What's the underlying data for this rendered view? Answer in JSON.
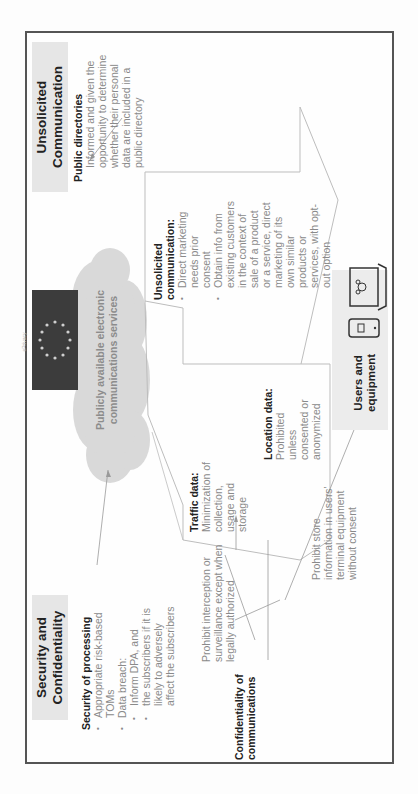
{
  "diagram": {
    "orientation": "rotated-90-ccw",
    "center": {
      "flag_label": "ePrivacy",
      "cloud_label_line1": "Publicly available electronic",
      "cloud_label_line2": "communications services"
    },
    "security_section": {
      "title_line1": "Security and",
      "title_line2": "Confidentiality",
      "processing": {
        "heading": "Security of processing",
        "items": [
          "Appropriate risk-based TOMs",
          "Data breach:"
        ],
        "item1_line1": "Appropriate risk-based",
        "item1_line2": "TOMs",
        "item2": "Data breach:",
        "sub_items": [
          "Inform DPA, and",
          "the subscribers if it is likely to adversely affect the subscribers"
        ],
        "sub1": "Inform DPA, and",
        "sub2_line1": "the subscribers if it is",
        "sub2_line2": "likely to adversely",
        "sub2_line3": "affect the subscribers"
      },
      "confidentiality": {
        "heading_line1": "Confidentiality of",
        "heading_line2": "communications",
        "interception_line1": "Prohibit interception or",
        "interception_line2": "surveillance except when",
        "interception_line3": "legally authorized",
        "storage_line1": "Prohibit store",
        "storage_line2": "information in users'",
        "storage_line3": "terminal equipment",
        "storage_line4": "without consent"
      }
    },
    "traffic": {
      "heading": "Traffic data:",
      "line1": "Minimization of",
      "line2": "collection,",
      "line3": "usage and",
      "line4": "storage"
    },
    "location": {
      "heading": "Location data:",
      "line1": "Prohibited",
      "line2": "unless",
      "line3": "consented or",
      "line4": "anonymized"
    },
    "unsolicited_arrow": {
      "heading_line1": "Unsolicited",
      "heading_line2": "communication:",
      "b1_line1": "Direct marketing",
      "b1_line2": "needs prior",
      "b1_line3": "consent",
      "b2_line1": "Obtain info from",
      "b2_line2": "existing customers",
      "b2_line3": "in the context of",
      "b2_line4": "sale of a product",
      "b2_line5": "or a service, direct",
      "b2_line6": "marketing of its",
      "b2_line7": "own similar",
      "b2_line8": "products or",
      "b2_line9": "services, with opt-",
      "b2_line10": "out option"
    },
    "unsolicited_section": {
      "title_line1": "Unsolicited",
      "title_line2": "Communication",
      "public_dir": {
        "heading": "Public directories",
        "line1": "Informed and given the",
        "line2": "opportunity to determine",
        "line3": "whether their personal",
        "line4": "data are included in a",
        "line5": "public directory"
      }
    },
    "users": {
      "label_line1": "Users and",
      "label_line2": "equipment",
      "icons": [
        "smartphone-icon",
        "laptop-icon"
      ]
    },
    "colors": {
      "frame": "#555555",
      "title_bg": "#e6e6e6",
      "cloud": "#d9d9d9",
      "flag": "#3c3c3c",
      "body_text": "#8a8a8a",
      "heading_text": "#222222"
    }
  }
}
